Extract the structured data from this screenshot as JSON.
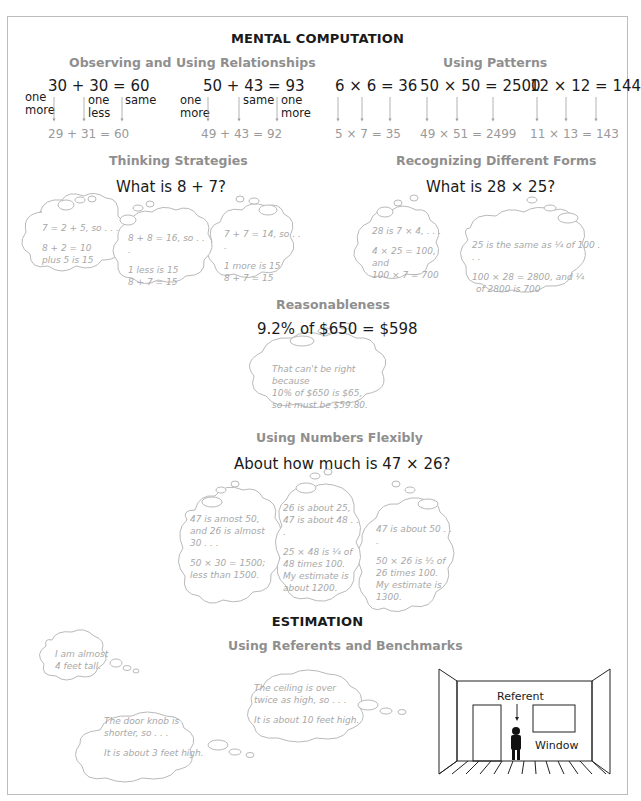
{
  "title": "MENTAL COMPUTATION",
  "observing": {
    "heading": "Observing and Using Relationships",
    "eq1": "30 + 30  =  60",
    "eq1_labels": [
      "one more",
      "one less",
      "same"
    ],
    "res1": "29  +  31   =   60",
    "eq2": "50 + 43  =  93",
    "eq2_labels": [
      "one more",
      "same",
      "one more"
    ],
    "res2": "49  +  43   =   92"
  },
  "patterns": {
    "heading": "Using Patterns",
    "items": [
      {
        "eq": "6 × 6 = 36",
        "res": "5  ×  7  =  35"
      },
      {
        "eq": "50 × 50 = 2500",
        "res": "49  ×  51  =  2499"
      },
      {
        "eq": "12 × 12 = 144",
        "res": "11  ×  13  =  143"
      }
    ]
  },
  "thinking": {
    "heading": "Thinking Strategies",
    "question": "What is 8 + 7?",
    "bubbles": [
      {
        "line1": "7 = 2 + 5, so . . .",
        "line2": "8 + 2 = 10",
        "line3": "plus 5 is 15"
      },
      {
        "line1": "8 + 8 = 16, so . . .",
        "line2": "1 less is 15",
        "line3": "8 + 7 = 15"
      },
      {
        "line1": "7 + 7 = 14, so . . .",
        "line2": "1 more is 15",
        "line3": "8 + 7 = 15"
      }
    ]
  },
  "forms": {
    "heading": "Recognizing Different Forms",
    "question": "What is 28 × 25?",
    "bubbles": [
      {
        "line1": "28 is 7 × 4, . . .",
        "line2": "4 × 25 = 100, and",
        "line3": "100 × 7 = 700"
      },
      {
        "line1": "25 is the same as ¼ of 100 . . .",
        "line2": "100 × 28 = 2800, and ¼",
        "line3": "of 2800 is 700"
      }
    ]
  },
  "reasonableness": {
    "heading": "Reasonableness",
    "question": "9.2% of $650 = $598",
    "bubble": {
      "line1": "That can't be right because",
      "line2": "10% of $650 is $65,",
      "line3": "so it must be $59.80."
    }
  },
  "flexibly": {
    "heading": "Using Numbers Flexibly",
    "question": "About how much is 47 × 26?",
    "bubbles": [
      {
        "a": "47 is amost 50, and 26 is almost 30 . . .",
        "b": "50 × 30 = 1500; less than 1500."
      },
      {
        "a": "26 is about 25, 47 is about 48 . . .",
        "b": "25 × 48 is ¼ of 48 times 100. My estimate is about 1200."
      },
      {
        "a": "47 is about 50 . . .",
        "b": "50 × 26 is ½ of 26 times 100. My estimate is 1300."
      }
    ]
  },
  "estimation": {
    "title": "ESTIMATION",
    "heading": "Using Referents and Benchmarks",
    "bubbles": [
      {
        "a": "I am almost 4 feet tall."
      },
      {
        "a": "The door knob is shorter, so . . .",
        "b": "It is about 3 feet high."
      },
      {
        "a": "The ceiling is over twice as high, so . . .",
        "b": "It is about 10 feet high."
      }
    ],
    "room": {
      "referent_label": "Referent",
      "window_label": "Window"
    }
  }
}
